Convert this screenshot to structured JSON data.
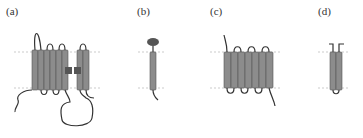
{
  "figure": {
    "panels": [
      {
        "id": "a",
        "label": "(a)",
        "label_x": 6,
        "label_y": 5,
        "description": "seven-transmembrane helix bundle plus two helices with square domains and long intracellular loop"
      },
      {
        "id": "b",
        "label": "(b)",
        "label_x": 137,
        "label_y": 5,
        "description": "single transmembrane helix with extracellular globular domain"
      },
      {
        "id": "c",
        "label": "(c)",
        "label_x": 210,
        "label_y": 5,
        "description": "seven-transmembrane helix bundle"
      },
      {
        "id": "d",
        "label": "(d)",
        "label_x": 318,
        "label_y": 5,
        "description": "two-helix hairpin"
      }
    ],
    "colors": {
      "helix_fill": "#8c8c8c",
      "helix_stroke": "#555555",
      "loop_stroke": "#333333",
      "domain_fill": "#555555",
      "membrane_line": "#aaaaaa"
    },
    "membrane": {
      "top_y": 52,
      "bottom_y": 88
    }
  }
}
